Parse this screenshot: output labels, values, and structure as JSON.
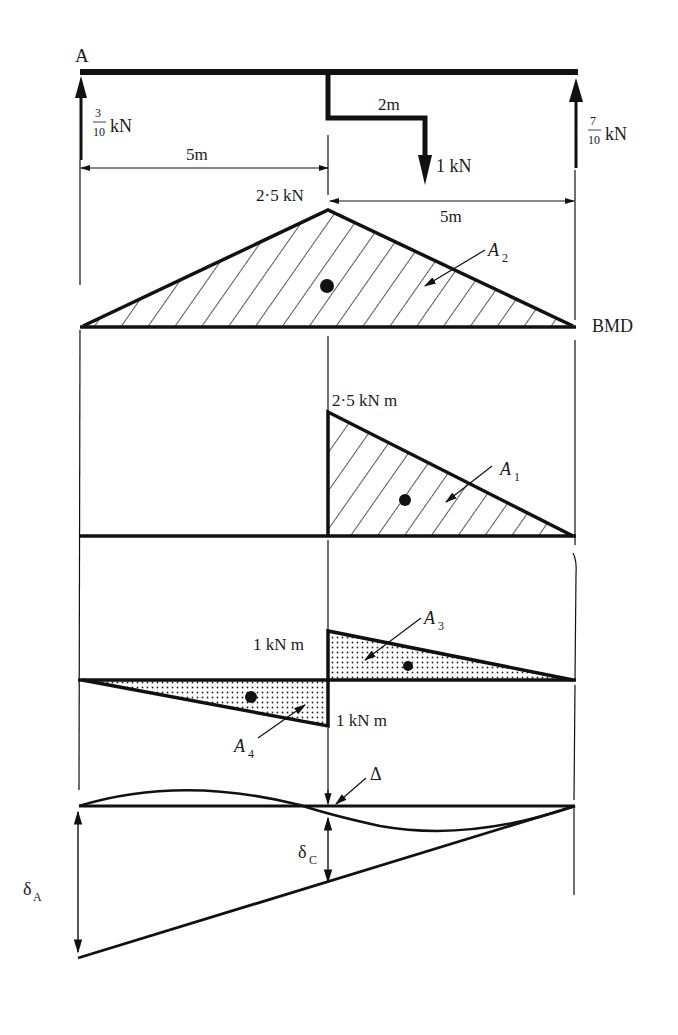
{
  "diagram": {
    "point_label": "A",
    "beam": {
      "left_reaction": {
        "num": "3",
        "den": "10",
        "unit": "kN"
      },
      "right_reaction": {
        "num": "7",
        "den": "10",
        "unit": "kN"
      },
      "bracket_offset": "2m",
      "load": "1 kN",
      "left_span": "5m",
      "right_span": "5m"
    },
    "bmd": {
      "peak_label": "2·5 kN",
      "area_label": "A",
      "area_sub": "2",
      "name": "BMD"
    },
    "moment_a1": {
      "peak_label": "2·5 kN m",
      "area_label": "A",
      "area_sub": "1"
    },
    "moment_a3_a4": {
      "top_label": "1 kN m",
      "bottom_label": "1 kN m",
      "a3_label": "A",
      "a3_sub": "3",
      "a4_label": "A",
      "a4_sub": "4"
    },
    "deflection": {
      "delta_label": "Δ",
      "delta_a_label": "δ",
      "delta_a_sub": "A",
      "delta_c_label": "δ",
      "delta_c_sub": "C"
    },
    "colors": {
      "ink": "#111111",
      "background": "#ffffff"
    }
  }
}
